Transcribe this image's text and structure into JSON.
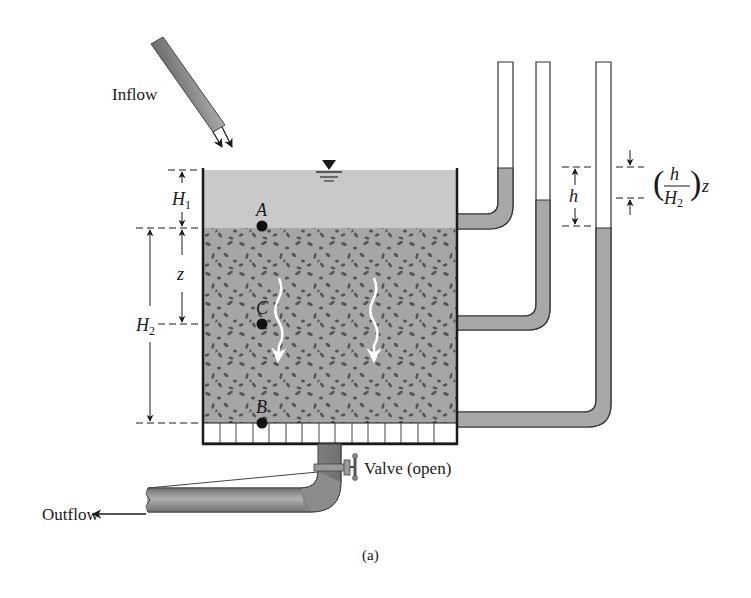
{
  "labels": {
    "inflow": "Inflow",
    "outflow": "Outflow",
    "valve": "Valve (open)",
    "caption": "(a)"
  },
  "points": {
    "a": "A",
    "b": "B",
    "c": "C"
  },
  "dimensions": {
    "h1_main": "H",
    "h1_sub": "1",
    "h2_main": "H",
    "h2_sub": "2",
    "z": "z",
    "h": "h",
    "ratio_num": "h",
    "ratio_den_main": "H",
    "ratio_den_sub": "2",
    "ratio_z": "z",
    "paren_open": "(",
    "paren_close": ")"
  },
  "colors": {
    "water": "#c9c9c9",
    "soil": "#a6a6a6",
    "soil_grain": "#555555",
    "pipe": "#8f8f8f",
    "outline": "#1a1a1a",
    "flow_arrow": "#ffffff"
  },
  "icons": {
    "free_surface": "inverted-triangle-water-level",
    "flow_arrows": "wavy-down-arrows"
  }
}
